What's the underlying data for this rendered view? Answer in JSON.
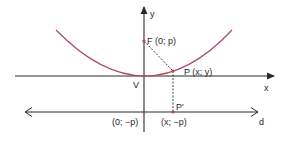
{
  "diagram": {
    "type": "parabola-focus-directrix",
    "colors": {
      "parabola": "#b04a5a",
      "axes": "#2a2a2a",
      "points": "#b04a5a",
      "background": "#ffffff"
    },
    "axes": {
      "x_label": "x",
      "y_label": "y"
    },
    "directrix": {
      "label": "d"
    },
    "points": {
      "vertex": {
        "label": "V"
      },
      "focus": {
        "label": "F (0; p)"
      },
      "point": {
        "label": "P (x; y)"
      },
      "projection": {
        "label": "P'"
      },
      "directrix_origin": {
        "label": "(0; −p)"
      },
      "directrix_projection": {
        "label": "(x; −p)"
      }
    }
  }
}
